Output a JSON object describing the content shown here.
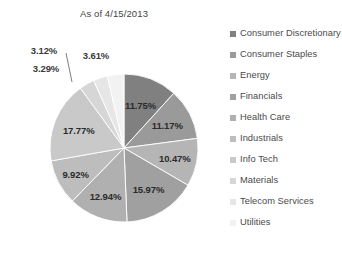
{
  "chart_data": {
    "type": "pie",
    "title": "As of 4/15/2013",
    "xlabel": "",
    "ylabel": "",
    "legend_position": "right",
    "grid": false,
    "start_angle_deg": 0,
    "direction": "clockwise",
    "categories": [
      "Consumer Discretionary",
      "Consumer Staples",
      "Energy",
      "Financials",
      "Health Care",
      "Industrials",
      "Info Tech",
      "Materials",
      "Telecom Services",
      "Utilities"
    ],
    "values": [
      11.75,
      11.17,
      10.47,
      15.97,
      12.94,
      9.92,
      17.77,
      3.29,
      3.12,
      3.61
    ],
    "value_labels": [
      "11.75%",
      "11.17%",
      "10.47%",
      "15.97%",
      "12.94%",
      "9.92%",
      "17.77%",
      "3.29%",
      "3.12%",
      "3.61%"
    ],
    "colors": [
      "#808080",
      "#9a9a9a",
      "#b5b5b5",
      "#a0a0a0",
      "#b0b0b0",
      "#bdbdbd",
      "#c9c9c9",
      "#d6d6d6",
      "#e6e6e6",
      "#f2f2f2"
    ],
    "label_placement": [
      "inside",
      "inside",
      "inside",
      "inside",
      "inside",
      "inside",
      "inside",
      "outside",
      "outside-leader",
      "outside"
    ],
    "units": "percent"
  },
  "legend": {
    "items": [
      {
        "label": "Consumer Discretionary",
        "color": "#808080"
      },
      {
        "label": "Consumer Staples",
        "color": "#9a9a9a"
      },
      {
        "label": "Energy",
        "color": "#b5b5b5"
      },
      {
        "label": "Financials",
        "color": "#a0a0a0"
      },
      {
        "label": "Health Care",
        "color": "#b0b0b0"
      },
      {
        "label": "Industrials",
        "color": "#bdbdbd"
      },
      {
        "label": "Info Tech",
        "color": "#c9c9c9"
      },
      {
        "label": "Materials",
        "color": "#d6d6d6"
      },
      {
        "label": "Telecom Services",
        "color": "#e6e6e6"
      },
      {
        "label": "Utilities",
        "color": "#f2f2f2"
      }
    ]
  }
}
